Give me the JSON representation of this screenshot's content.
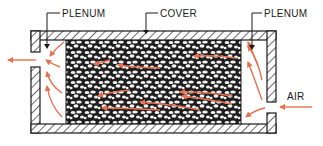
{
  "diagram": {
    "type": "cross-section",
    "labels": {
      "plenum_left": "PLENUM",
      "cover": "COVER",
      "plenum_right": "PLENUM",
      "air": "AIR"
    },
    "colors": {
      "line": "#1a1a1a",
      "arrow": "#e8704f",
      "background": "#ffffff",
      "gravel_dark": "#1e1e1e",
      "gravel_light": "#f2f2f2"
    },
    "components": [
      {
        "name": "cover",
        "label": "COVER"
      },
      {
        "name": "left-plenum",
        "label": "PLENUM"
      },
      {
        "name": "right-plenum",
        "label": "PLENUM"
      },
      {
        "name": "rock-bed"
      },
      {
        "name": "air-inlet",
        "label": "AIR"
      },
      {
        "name": "air-outlet"
      }
    ],
    "flow_direction": "right-to-left"
  }
}
